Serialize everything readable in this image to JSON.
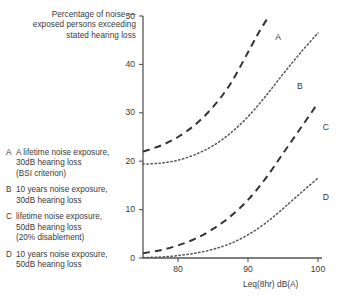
{
  "chart_data": {
    "type": "line",
    "title": "Percentage of noise — exposed persons exceeding stated hearing loss",
    "title_lines": [
      "Percentage of noise —",
      "exposed persons exceeding",
      "stated hearing loss"
    ],
    "xlabel": "Leq(8hr) dB(A)",
    "ylabel": "Percentage of noise — exposed persons exceeding stated hearing loss",
    "xlim": [
      75,
      100
    ],
    "ylim": [
      0,
      50
    ],
    "xticks": [
      80,
      90,
      100
    ],
    "xtick_labels": [
      "80",
      "90",
      "100"
    ],
    "yticks": [
      0,
      10,
      20,
      30,
      40,
      50
    ],
    "ytick_labels": [
      "0",
      "10",
      "20",
      "30",
      "40",
      "50"
    ],
    "grid": false,
    "legend_position": "left",
    "series": [
      {
        "name": "A",
        "style": "dashed",
        "label": "A",
        "color": "#333333",
        "x": [
          75,
          77.5,
          80,
          82.5,
          85,
          87.5,
          90,
          91.5,
          93
        ],
        "values": [
          22.0,
          23.2,
          25.0,
          27.6,
          31.2,
          36.0,
          42.5,
          46.5,
          50.0
        ]
      },
      {
        "name": "B",
        "style": "dotted",
        "label": "B",
        "color": "#555555",
        "x": [
          75,
          77.5,
          80,
          82.5,
          85,
          87.5,
          90,
          92.5,
          95,
          97.5,
          100
        ],
        "values": [
          19.4,
          19.6,
          20.2,
          21.4,
          23.2,
          25.8,
          29.2,
          33.4,
          38.0,
          42.4,
          46.5
        ]
      },
      {
        "name": "C",
        "style": "dashed",
        "label": "C",
        "color": "#333333",
        "x": [
          75,
          77.5,
          80,
          82.5,
          85,
          87.5,
          90,
          92.5,
          95,
          97.5,
          100
        ],
        "values": [
          1.0,
          1.6,
          2.6,
          4.0,
          6.0,
          8.6,
          12.0,
          16.4,
          21.6,
          26.8,
          32.0
        ]
      },
      {
        "name": "D",
        "style": "dotted",
        "label": "D",
        "color": "#555555",
        "x": [
          75,
          77.5,
          80,
          82.5,
          85,
          87.5,
          90,
          92.5,
          95,
          97.5,
          100
        ],
        "values": [
          0.1,
          0.2,
          0.5,
          1.0,
          1.8,
          3.0,
          4.8,
          7.2,
          10.2,
          13.4,
          16.5
        ]
      }
    ],
    "annotations": [
      {
        "text": "A",
        "x": 93.6,
        "y": 45.5
      },
      {
        "text": "B",
        "x": 96.7,
        "y": 35.5
      },
      {
        "text": "C",
        "x": 100.4,
        "y": 27.0
      },
      {
        "text": "D",
        "x": 100.4,
        "y": 12.5
      }
    ]
  },
  "legend": {
    "items": [
      {
        "key": "A",
        "lines": [
          "A lifetime noise exposure,",
          "30dB hearing loss",
          "(BSI criterion)"
        ]
      },
      {
        "key": "B",
        "lines": [
          "10 years noise exposure,",
          "30dB hearing loss"
        ]
      },
      {
        "key": "C",
        "lines": [
          "lifetime noise exposure,",
          "50dB hearing loss",
          "(20% disablement)"
        ]
      },
      {
        "key": "D",
        "lines": [
          "10 years noise exposure,",
          "50dB hearing loss"
        ]
      }
    ]
  }
}
